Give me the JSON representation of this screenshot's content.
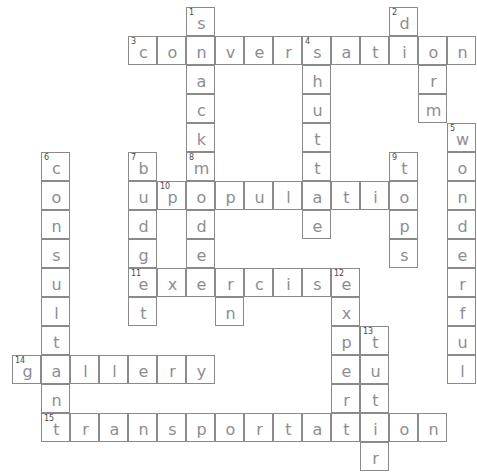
{
  "puzzle": {
    "type": "crossword",
    "title": "Handwritten crossword grid",
    "cell_size": 29,
    "grid_origin": {
      "x": 12,
      "y": 7
    },
    "ink_color": "#8d8d93",
    "grid_line_color": "#8a8a8a",
    "background": "#ffffff",
    "entries": [
      {
        "number": 1,
        "direction": "down",
        "answer": "snack",
        "col": 6,
        "row": 0
      },
      {
        "number": 2,
        "direction": "down",
        "answer": "dorm",
        "col": 13,
        "row": 0
      },
      {
        "number": 3,
        "direction": "across",
        "answer": "conversation",
        "col": 4,
        "row": 1
      },
      {
        "number": 4,
        "direction": "down",
        "answer": "shuttle",
        "col": 9,
        "row": 1
      },
      {
        "number": 5,
        "direction": "down",
        "answer": "wonderful",
        "col": 14,
        "row": 4
      },
      {
        "number": 6,
        "direction": "down",
        "answer": "consultant",
        "col": 1,
        "row": 5
      },
      {
        "number": 7,
        "direction": "down",
        "answer": "budget",
        "col": 4,
        "row": 5
      },
      {
        "number": 8,
        "direction": "down",
        "answer": "modern",
        "col": 6,
        "row": 5
      },
      {
        "number": 9,
        "direction": "down",
        "answer": "tips",
        "col": 12,
        "row": 5
      },
      {
        "number": 10,
        "direction": "across",
        "answer": "population",
        "col": 5,
        "row": 6
      },
      {
        "number": 11,
        "direction": "across",
        "answer": "exercise",
        "col": 4,
        "row": 9
      },
      {
        "number": 12,
        "direction": "down",
        "answer": "expert",
        "col": 11,
        "row": 9
      },
      {
        "number": 13,
        "direction": "down",
        "answer": "tutor",
        "col": 12,
        "row": 11
      },
      {
        "number": 14,
        "direction": "across",
        "answer": "gallery",
        "col": 0,
        "row": 12
      },
      {
        "number": 15,
        "direction": "across",
        "answer": "transportation",
        "col": 1,
        "row": 14
      }
    ],
    "cells": [
      {
        "col": 6,
        "row": 0,
        "letter": "s",
        "number": 1
      },
      {
        "col": 13,
        "row": 0,
        "letter": "d",
        "number": 2
      },
      {
        "col": 4,
        "row": 1,
        "letter": "c",
        "number": 3
      },
      {
        "col": 5,
        "row": 1,
        "letter": "o"
      },
      {
        "col": 6,
        "row": 1,
        "letter": "n"
      },
      {
        "col": 7,
        "row": 1,
        "letter": "v"
      },
      {
        "col": 8,
        "row": 1,
        "letter": "e"
      },
      {
        "col": 9,
        "row": 1,
        "letter": "r"
      },
      {
        "col": 10,
        "row": 1,
        "letter": "s",
        "number": 4
      },
      {
        "col": 11,
        "row": 1,
        "letter": "a"
      },
      {
        "col": 12,
        "row": 1,
        "letter": "t"
      },
      {
        "col": 13,
        "row": 1,
        "letter": "i"
      },
      {
        "col": 14,
        "row": 1,
        "letter": "o"
      },
      {
        "col": 15,
        "row": 1,
        "letter": "n"
      },
      {
        "col": 6,
        "row": 2,
        "letter": "a"
      },
      {
        "col": 10,
        "row": 2,
        "letter": "h"
      },
      {
        "col": 14,
        "row": 2,
        "letter": "r"
      },
      {
        "col": 6,
        "row": 3,
        "letter": "c"
      },
      {
        "col": 10,
        "row": 3,
        "letter": "u"
      },
      {
        "col": 14,
        "row": 3,
        "letter": "m"
      },
      {
        "col": 6,
        "row": 4,
        "letter": "k"
      },
      {
        "col": 10,
        "row": 4,
        "letter": "t"
      },
      {
        "col": 15,
        "row": 4,
        "letter": "w",
        "number": 5
      },
      {
        "col": 1,
        "row": 5,
        "letter": "c",
        "number": 6
      },
      {
        "col": 4,
        "row": 5,
        "letter": "b",
        "number": 7
      },
      {
        "col": 6,
        "row": 5,
        "letter": "m",
        "number": 8
      },
      {
        "col": 10,
        "row": 5,
        "letter": "t"
      },
      {
        "col": 13,
        "row": 5,
        "letter": "t",
        "number": 9
      },
      {
        "col": 15,
        "row": 5,
        "letter": "o"
      },
      {
        "col": 1,
        "row": 6,
        "letter": "o"
      },
      {
        "col": 4,
        "row": 6,
        "letter": "u"
      },
      {
        "col": 5,
        "row": 6,
        "letter": "p",
        "number": 10
      },
      {
        "col": 6,
        "row": 6,
        "letter": "o"
      },
      {
        "col": 7,
        "row": 6,
        "letter": "p"
      },
      {
        "col": 8,
        "row": 6,
        "letter": "u"
      },
      {
        "col": 9,
        "row": 6,
        "letter": "l"
      },
      {
        "col": 10,
        "row": 6,
        "letter": "a"
      },
      {
        "col": 11,
        "row": 6,
        "letter": "t"
      },
      {
        "col": 12,
        "row": 6,
        "letter": "i"
      },
      {
        "col": 13,
        "row": 6,
        "letter": "o"
      },
      {
        "col": 15,
        "row": 6,
        "letter": "n"
      },
      {
        "col": 1,
        "row": 7,
        "letter": "n"
      },
      {
        "col": 4,
        "row": 7,
        "letter": "d"
      },
      {
        "col": 6,
        "row": 7,
        "letter": "d"
      },
      {
        "col": 10,
        "row": 7,
        "letter": "e"
      },
      {
        "col": 13,
        "row": 7,
        "letter": "p"
      },
      {
        "col": 15,
        "row": 7,
        "letter": "d"
      },
      {
        "col": 1,
        "row": 8,
        "letter": "s"
      },
      {
        "col": 4,
        "row": 8,
        "letter": "g"
      },
      {
        "col": 6,
        "row": 8,
        "letter": "e"
      },
      {
        "col": 13,
        "row": 8,
        "letter": "s"
      },
      {
        "col": 15,
        "row": 8,
        "letter": "e"
      },
      {
        "col": 1,
        "row": 9,
        "letter": "u"
      },
      {
        "col": 4,
        "row": 9,
        "letter": "e",
        "number": 11
      },
      {
        "col": 5,
        "row": 9,
        "letter": "x"
      },
      {
        "col": 6,
        "row": 9,
        "letter": "e"
      },
      {
        "col": 7,
        "row": 9,
        "letter": "r"
      },
      {
        "col": 8,
        "row": 9,
        "letter": "c"
      },
      {
        "col": 9,
        "row": 9,
        "letter": "i"
      },
      {
        "col": 10,
        "row": 9,
        "letter": "s"
      },
      {
        "col": 11,
        "row": 9,
        "letter": "e",
        "number": 12
      },
      {
        "col": 15,
        "row": 9,
        "letter": "r"
      },
      {
        "col": 1,
        "row": 10,
        "letter": "l"
      },
      {
        "col": 4,
        "row": 10,
        "letter": "t"
      },
      {
        "col": 7,
        "row": 10,
        "letter": "n"
      },
      {
        "col": 11,
        "row": 10,
        "letter": "x"
      },
      {
        "col": 15,
        "row": 10,
        "letter": "f"
      },
      {
        "col": 1,
        "row": 11,
        "letter": "t"
      },
      {
        "col": 11,
        "row": 11,
        "letter": "p"
      },
      {
        "col": 12,
        "row": 11,
        "letter": "t",
        "number": 13
      },
      {
        "col": 15,
        "row": 11,
        "letter": "u"
      },
      {
        "col": 0,
        "row": 12,
        "letter": "g",
        "number": 14
      },
      {
        "col": 1,
        "row": 12,
        "letter": "a"
      },
      {
        "col": 2,
        "row": 12,
        "letter": "l"
      },
      {
        "col": 3,
        "row": 12,
        "letter": "l"
      },
      {
        "col": 4,
        "row": 12,
        "letter": "e"
      },
      {
        "col": 5,
        "row": 12,
        "letter": "r"
      },
      {
        "col": 6,
        "row": 12,
        "letter": "y"
      },
      {
        "col": 11,
        "row": 12,
        "letter": "e"
      },
      {
        "col": 12,
        "row": 12,
        "letter": "u"
      },
      {
        "col": 15,
        "row": 12,
        "letter": "l"
      },
      {
        "col": 1,
        "row": 13,
        "letter": "n"
      },
      {
        "col": 11,
        "row": 13,
        "letter": "r"
      },
      {
        "col": 12,
        "row": 13,
        "letter": "t"
      },
      {
        "col": 1,
        "row": 14,
        "letter": "t",
        "number": 15
      },
      {
        "col": 2,
        "row": 14,
        "letter": "r"
      },
      {
        "col": 3,
        "row": 14,
        "letter": "a"
      },
      {
        "col": 4,
        "row": 14,
        "letter": "n"
      },
      {
        "col": 5,
        "row": 14,
        "letter": "s"
      },
      {
        "col": 6,
        "row": 14,
        "letter": "p"
      },
      {
        "col": 7,
        "row": 14,
        "letter": "o"
      },
      {
        "col": 8,
        "row": 14,
        "letter": "r"
      },
      {
        "col": 9,
        "row": 14,
        "letter": "t"
      },
      {
        "col": 10,
        "row": 14,
        "letter": "a"
      },
      {
        "col": 11,
        "row": 14,
        "letter": "t"
      },
      {
        "col": 12,
        "row": 14,
        "letter": "i"
      },
      {
        "col": 13,
        "row": 14,
        "letter": "o"
      },
      {
        "col": 14,
        "row": 14,
        "letter": "n"
      },
      {
        "col": 12,
        "row": 15,
        "letter": "r"
      }
    ]
  }
}
